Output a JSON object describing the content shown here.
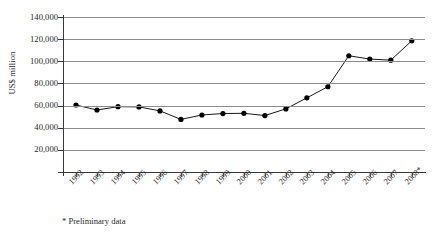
{
  "chart_data": {
    "type": "line",
    "title": "",
    "xlabel": "",
    "ylabel": "US$ million",
    "categories": [
      "1992",
      "1993",
      "1994",
      "1995",
      "1996",
      "1997",
      "1998",
      "1999",
      "2000",
      "2001",
      "2002",
      "2003",
      "2004",
      "2005",
      "2006",
      "2007",
      "2008*"
    ],
    "values": [
      60500,
      56000,
      59000,
      58800,
      55200,
      47500,
      51500,
      52800,
      53000,
      51000,
      57000,
      67000,
      77000,
      105000,
      102000,
      101000,
      118500
    ],
    "series": [
      {
        "name": "US$ million",
        "values": [
          60500,
          56000,
          59000,
          58800,
          55200,
          47500,
          51500,
          52800,
          53000,
          51000,
          57000,
          67000,
          77000,
          105000,
          102000,
          101000,
          118500
        ]
      }
    ],
    "ylim": [
      0,
      140000
    ],
    "yticks": [
      20000,
      40000,
      60000,
      80000,
      100000,
      120000,
      140000
    ],
    "ytick_labels": [
      "20,000",
      "40,000",
      "60,000",
      "80,000",
      "100,000",
      "120,000",
      "140,000"
    ],
    "grid": true,
    "legend": "none",
    "marker": "filled-circle",
    "line_color": "#1a1a1a",
    "marker_color": "#000000",
    "grid_color": "#8d8d8d",
    "axis_color": "#3a3a3a",
    "background": "#ffffff"
  },
  "footnote": {
    "text": "* Preliminary data"
  }
}
